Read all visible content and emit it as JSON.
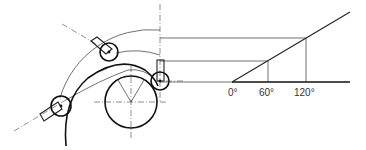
{
  "diagram": {
    "angle_axis": {
      "ticks": [
        {
          "label": "0°",
          "angle": 0
        },
        {
          "label": "60°",
          "angle": 60
        },
        {
          "label": "120°",
          "angle": 120
        }
      ]
    },
    "components": {
      "cam": "circular cam with V-shaped center marks",
      "followers": [
        "left roller follower",
        "top roller follower",
        "right roller follower"
      ],
      "guide_curve": "thick curved track",
      "arcs": [
        "outer thin arc",
        "inner thin arc"
      ]
    }
  }
}
